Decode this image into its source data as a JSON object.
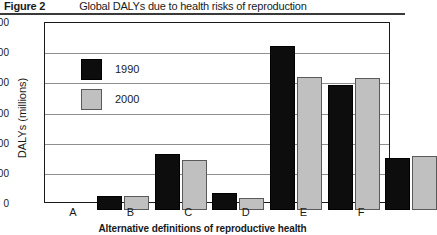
{
  "figure": {
    "label": "Figure 2",
    "title": "Global DALYs due to health risks of reproduction"
  },
  "chart_data": {
    "type": "bar",
    "title": "Global DALYs due to health risks of reproduction",
    "categories": [
      "A",
      "B",
      "C",
      "D",
      "E",
      "F"
    ],
    "series": [
      {
        "name": "1990",
        "color": "#0d0d0d",
        "values": [
          48,
          185,
          57,
          545,
          416,
          172
        ]
      },
      {
        "name": "2000",
        "color": "#c0c0c0",
        "values": [
          48,
          166,
          40,
          442,
          436,
          178
        ]
      }
    ],
    "xlabel": "Alternative definitions of reproductive health",
    "ylabel": "DALYs (millions)",
    "ylim": [
      0,
      600
    ],
    "yticks": [
      0,
      100,
      200,
      300,
      400,
      500,
      600
    ],
    "ytick_labels": [
      "0",
      "100",
      "200",
      "300",
      "400",
      "500",
      "600"
    ],
    "grid": true,
    "legend_position": "upper-left-inside"
  }
}
